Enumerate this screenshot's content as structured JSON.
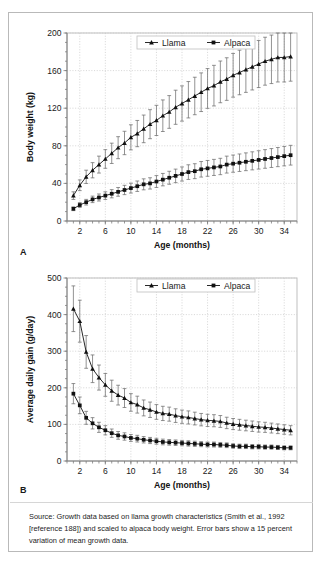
{
  "figure": {
    "panel_a_letter": "A",
    "panel_b_letter": "B",
    "source_note": "Source: Growth data based on llama growth characteristics (Smith et al., 1992 [reference 188]) and scaled to alpaca body weight. Error bars show a 15 percent variation of mean growth data.",
    "series_colors": {
      "line": "#111111",
      "error_bar": "#6e6e6e",
      "grid": "#c9c9c9"
    }
  },
  "chart_data": [
    {
      "id": "panel-a",
      "type": "line",
      "title": "",
      "xlabel": "Age (months)",
      "ylabel": "Body weight (kg)",
      "xlim": [
        0,
        36
      ],
      "ylim": [
        0,
        200
      ],
      "yticks": [
        0,
        40,
        80,
        120,
        160,
        200
      ],
      "xticks": [
        2,
        6,
        10,
        14,
        18,
        22,
        26,
        30,
        34
      ],
      "xtick_minor_step": 1,
      "grid": true,
      "legend_position": "top-center",
      "error_bars": "15 percent of mean",
      "x": [
        1,
        2,
        3,
        4,
        5,
        6,
        7,
        8,
        9,
        10,
        11,
        12,
        13,
        14,
        15,
        16,
        17,
        18,
        19,
        20,
        21,
        22,
        23,
        24,
        25,
        26,
        27,
        28,
        29,
        30,
        31,
        32,
        33,
        34,
        35
      ],
      "series": [
        {
          "name": "Llama",
          "marker": "triangle",
          "values": [
            27,
            38,
            47,
            54,
            60,
            66,
            72,
            78,
            83,
            89,
            93,
            98,
            103,
            107,
            112,
            116,
            121,
            125,
            129,
            133,
            137,
            141,
            144,
            148,
            151,
            155,
            158,
            161,
            164,
            167,
            170,
            172,
            174,
            174,
            175
          ]
        },
        {
          "name": "Alpaca",
          "marker": "square",
          "values": [
            13,
            17,
            20,
            23,
            25,
            27,
            29,
            31,
            33,
            35,
            37,
            39,
            40,
            42,
            44,
            46,
            48,
            50,
            52,
            53,
            55,
            56,
            57,
            58,
            60,
            61,
            62,
            63,
            64,
            65,
            66,
            67,
            68,
            69,
            70
          ]
        }
      ]
    },
    {
      "id": "panel-b",
      "type": "line",
      "title": "",
      "xlabel": "Age (months)",
      "ylabel": "Average daily gain (g/day)",
      "xlim": [
        0,
        36
      ],
      "ylim": [
        0,
        500
      ],
      "yticks": [
        0,
        100,
        200,
        300,
        400,
        500
      ],
      "xticks": [
        2,
        6,
        10,
        14,
        18,
        22,
        26,
        30,
        34
      ],
      "xtick_minor_step": 1,
      "grid": true,
      "legend_position": "top-center",
      "error_bars": "15 percent of mean",
      "x": [
        1,
        2,
        3,
        4,
        5,
        6,
        7,
        8,
        9,
        10,
        11,
        12,
        13,
        14,
        15,
        16,
        17,
        18,
        19,
        20,
        21,
        22,
        23,
        24,
        25,
        26,
        27,
        28,
        29,
        30,
        31,
        32,
        33,
        34,
        35
      ],
      "series": [
        {
          "name": "Llama",
          "marker": "triangle",
          "values": [
            416,
            382,
            298,
            252,
            228,
            208,
            192,
            180,
            172,
            160,
            154,
            145,
            140,
            134,
            130,
            128,
            124,
            121,
            119,
            116,
            113,
            111,
            110,
            108,
            104,
            101,
            99,
            97,
            95,
            93,
            92,
            90,
            88,
            86,
            84
          ]
        },
        {
          "name": "Alpaca",
          "marker": "square",
          "values": [
            184,
            152,
            118,
            103,
            92,
            84,
            76,
            70,
            67,
            63,
            61,
            58,
            56,
            54,
            52,
            51,
            50,
            49,
            48,
            47,
            46,
            45,
            45,
            44,
            43,
            41,
            40,
            40,
            39,
            39,
            38,
            38,
            37,
            36,
            36
          ]
        }
      ]
    }
  ]
}
